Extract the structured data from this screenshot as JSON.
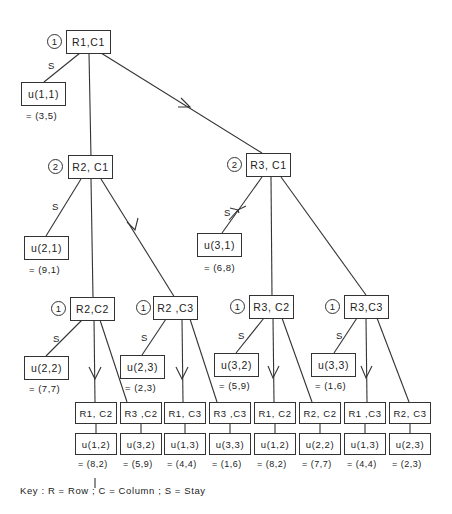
{
  "diagram": {
    "type": "game-tree",
    "nodes": {
      "root": {
        "label": "R1,C1",
        "stage": "1"
      },
      "u11": {
        "label": "u(1,1)",
        "payoff": "= (3,5)"
      },
      "r2c1": {
        "label": "R2, C1",
        "stage": "2"
      },
      "r3c1": {
        "label": "R3, C1",
        "stage": "2"
      },
      "u21": {
        "label": "u(2,1)",
        "payoff": "= (9,1)"
      },
      "u31": {
        "label": "u(3,1)",
        "payoff": "= (6,8)"
      },
      "r2c2": {
        "label": "R2,C2",
        "stage": "1"
      },
      "r2c3": {
        "label": "R2 ,C3",
        "stage": "1"
      },
      "r3c2": {
        "label": "R3, C2",
        "stage": "1"
      },
      "r3c3": {
        "label": "R3,C3",
        "stage": "1"
      },
      "u22": {
        "label": "u(2,2)",
        "payoff": "= (7,7)"
      },
      "u23": {
        "label": "u(2,3)",
        "payoff": "= (2,3)"
      },
      "u32": {
        "label": "u(3,2)",
        "payoff": "= (5,9)"
      },
      "u33": {
        "label": "u(3,3)",
        "payoff": "= (1,6)"
      },
      "leaves": [
        {
          "label": "R1, C2",
          "u": "u(1,2)",
          "payoff": "= (8,2)"
        },
        {
          "label": "R3 ,C2",
          "u": "u(3,2)",
          "payoff": "= (5,9)"
        },
        {
          "label": "R1, C3",
          "u": "u(1,3)",
          "payoff": "= (4,4)"
        },
        {
          "label": "R3 ,C3",
          "u": "u(3,3)",
          "payoff": "= (1,6)"
        },
        {
          "label": "R1, C2",
          "u": "u(1,2)",
          "payoff": "= (8,2)"
        },
        {
          "label": "R2, C2",
          "u": "u(2,2)",
          "payoff": "= (7,7)"
        },
        {
          "label": "R1 ,C3",
          "u": "u(1,3)",
          "payoff": "= (4,4)"
        },
        {
          "label": "R2, C3",
          "u": "u(2,3)",
          "payoff": "= (2,3)"
        }
      ]
    },
    "edge_labels": {
      "stay": "S"
    },
    "key": "Key :   R = Row ;   C = Column ;   S = Stay"
  }
}
